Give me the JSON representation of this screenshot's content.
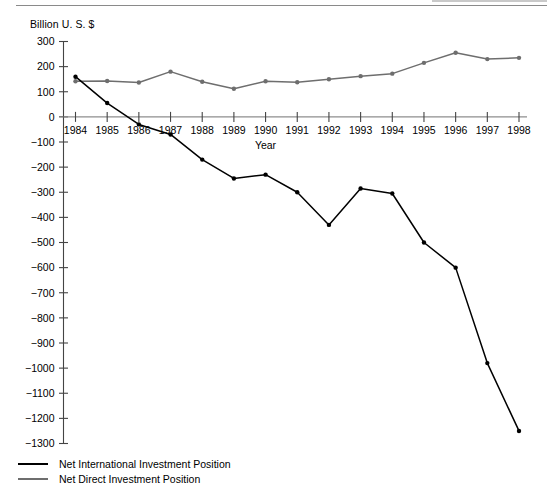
{
  "figure": {
    "unit_label": "Billion U. S. $",
    "x_axis_title": "Year"
  },
  "chart_data": {
    "type": "line",
    "title": "",
    "subtitle": "",
    "xlabel": "Year",
    "ylabel": "Billion U. S. $",
    "x": [
      1984,
      1985,
      1986,
      1987,
      1988,
      1989,
      1990,
      1991,
      1992,
      1993,
      1994,
      1995,
      1996,
      1997,
      1998
    ],
    "categories": [
      "1984",
      "1985",
      "1986",
      "1987",
      "1988",
      "1989",
      "1990",
      "1991",
      "1992",
      "1993",
      "1994",
      "1995",
      "1996",
      "1997",
      "1998"
    ],
    "xlim": [
      1984,
      1998
    ],
    "ylim": [
      -1300,
      300
    ],
    "yticks": [
      300,
      200,
      100,
      0,
      -100,
      -200,
      -300,
      -400,
      -500,
      -600,
      -700,
      -800,
      -900,
      -1000,
      -1100,
      -1200,
      -1300
    ],
    "ytick_labels": [
      "300",
      "200",
      "100",
      "0",
      "−100",
      "−200",
      "−300",
      "−400",
      "−500",
      "−600",
      "−700",
      "−800",
      "−900",
      "−1000",
      "−1100",
      "−1200",
      "−1300"
    ],
    "grid": false,
    "legend_position": "below-left",
    "markers": "filled-circle",
    "series": [
      {
        "name": "Net International Investment Position",
        "color": "#000000",
        "values": [
          160,
          55,
          -30,
          -70,
          -170,
          -245,
          -230,
          -300,
          -430,
          -285,
          -305,
          -500,
          -600,
          -980,
          -1250
        ]
      },
      {
        "name": "Net Direct Investment Position",
        "color": "#6e6e6e",
        "values": [
          142,
          143,
          137,
          180,
          140,
          112,
          142,
          138,
          150,
          162,
          172,
          215,
          255,
          230,
          235
        ]
      }
    ]
  },
  "legend": {
    "items": [
      {
        "label": "Net International Investment Position",
        "color": "#000000"
      },
      {
        "label": "Net Direct Investment Position",
        "color": "#6e6e6e"
      }
    ]
  }
}
